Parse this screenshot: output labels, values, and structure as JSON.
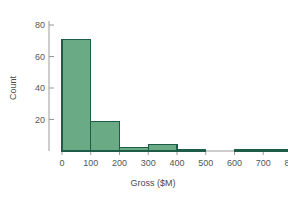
{
  "chart_data": {
    "type": "bar",
    "title": "",
    "subtitle": "",
    "xlabel": "Gross ($M)",
    "ylabel": "Count",
    "categories": [
      "0-100",
      "100-200",
      "200-300",
      "300-400",
      "400-500",
      "500-600",
      "600-700",
      "700-800"
    ],
    "bin_edges": [
      0,
      100,
      200,
      300,
      400,
      500,
      600,
      700,
      800
    ],
    "values": [
      71,
      19,
      2,
      4,
      1,
      0,
      1,
      1
    ],
    "bin_width": 100,
    "xlim": [
      0,
      800
    ],
    "ylim": [
      0,
      88
    ],
    "xticks": [
      0,
      100,
      200,
      300,
      400,
      500,
      600,
      700,
      800
    ],
    "xtick_labels": [
      "0",
      "100",
      "200",
      "300",
      "400",
      "500",
      "600",
      "700",
      "800"
    ],
    "yticks": [
      20,
      40,
      60,
      80
    ],
    "ytick_labels": [
      "20",
      "40",
      "60",
      "80"
    ],
    "grid": false,
    "legend": false,
    "legend_position": "none",
    "annotations": [],
    "colors": {
      "bar_fill": "#6aab85",
      "bar_stroke": "#1d5c47",
      "axis_line": "#9a9a9a",
      "tick_text": "#555555",
      "axis_title": "#4a4a4a",
      "background": "#ffffff"
    }
  }
}
